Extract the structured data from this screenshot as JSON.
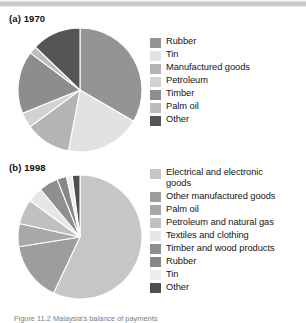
{
  "figure": {
    "caption": "Figure 11.2 Malaysia's balance of payments",
    "background_color": "#ffffff"
  },
  "panels": [
    {
      "id": "a",
      "title": "(a) 1970",
      "legend_items": [
        {
          "label": "Rubber",
          "color": "#949494"
        },
        {
          "label": "Tin",
          "color": "#e2e2e2"
        },
        {
          "label": "Manufactured goods",
          "color": "#b4b4b4"
        },
        {
          "label": "Petroleum",
          "color": "#d2d2d2"
        },
        {
          "label": "Timber",
          "color": "#8d8d8d"
        },
        {
          "label": "Palm oil",
          "color": "#bcbcbc"
        },
        {
          "label": "Other",
          "color": "#555555"
        }
      ]
    },
    {
      "id": "b",
      "title": "(b) 1998",
      "legend_items": [
        {
          "label": "Electrical and electronic\ngoods",
          "color": "#c6c6c6"
        },
        {
          "label": "Other manufactured goods",
          "color": "#9d9d9d"
        },
        {
          "label": "Palm oil",
          "color": "#a8a8a8"
        },
        {
          "label": "Petroleum and natural gas",
          "color": "#c0c0c0"
        },
        {
          "label": "Textiles and clothing",
          "color": "#e6e6e6"
        },
        {
          "label": "Timber and wood products",
          "color": "#8f8f8f"
        },
        {
          "label": "Rubber",
          "color": "#878787"
        },
        {
          "label": "Tin",
          "color": "#ededed"
        },
        {
          "label": "Other",
          "color": "#4f4f4f"
        }
      ]
    }
  ],
  "chart_data": [
    {
      "type": "pie",
      "title": "(a) 1970",
      "categories": [
        "Rubber",
        "Tin",
        "Manufactured goods",
        "Petroleum",
        "Timber",
        "Palm oil",
        "Other"
      ],
      "values": [
        33.4,
        19.6,
        11.9,
        4.0,
        16.3,
        2.0,
        12.8
      ],
      "unit": "percent",
      "legend_position": "right",
      "start_angle": 0,
      "direction": "clockwise",
      "colors": [
        "#949494",
        "#e2e2e2",
        "#b4b4b4",
        "#d2d2d2",
        "#8d8d8d",
        "#bcbcbc",
        "#555555"
      ]
    },
    {
      "type": "pie",
      "title": "(b) 1998",
      "categories": [
        "Electrical and electronic goods",
        "Other manufactured goods",
        "Palm oil",
        "Petroleum and natural gas",
        "Textiles and clothing",
        "Timber and wood products",
        "Rubber",
        "Tin",
        "Other"
      ],
      "values": [
        57.0,
        15.5,
        6.0,
        6.5,
        4.0,
        5.0,
        2.5,
        1.5,
        2.0
      ],
      "unit": "percent",
      "legend_position": "right",
      "start_angle": 0,
      "direction": "clockwise",
      "colors": [
        "#c6c6c6",
        "#9d9d9d",
        "#a8a8a8",
        "#c0c0c0",
        "#e6e6e6",
        "#8f8f8f",
        "#878787",
        "#ededed",
        "#4f4f4f"
      ]
    }
  ]
}
